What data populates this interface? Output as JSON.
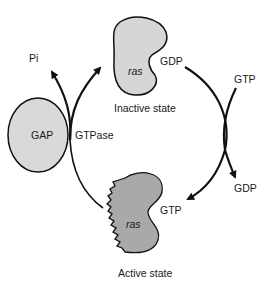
{
  "diagram": {
    "labels": {
      "pi": "Pi",
      "gap": "GAP",
      "gtpase": "GTPase",
      "ras_inactive": "ras",
      "gdp_bound": "GDP",
      "inactive_state": "Inactive state",
      "gtp_in": "GTP",
      "gdp_out": "GDP",
      "ras_active": "ras",
      "gtp_bound": "GTP",
      "active_state": "Active state"
    },
    "colors": {
      "inactive_fill": "#d6d6d6",
      "active_fill": "#a9a9a9",
      "gap_fill": "#d9d9d9",
      "stroke": "#111111"
    }
  }
}
